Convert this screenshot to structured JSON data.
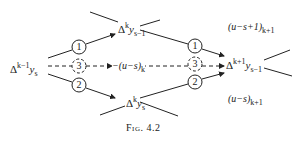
{
  "diagram": {
    "nodes": {
      "left": {
        "base": "Δ",
        "sup": "k−1",
        "var": "y",
        "sub": "s"
      },
      "top": {
        "base": "Δ",
        "sup": "k",
        "var": "y",
        "sub": "s−1"
      },
      "bottom": {
        "base": "Δ",
        "sup": "k",
        "var": "y",
        "sub": "s"
      },
      "right": {
        "base": "Δ",
        "sup": "k+1",
        "var": "y",
        "sub": "s−1"
      }
    },
    "circles": {
      "c1": "1",
      "c2": "2",
      "c3": "3",
      "r1": "1",
      "r2": "2",
      "r3": "3"
    },
    "mid_label": {
      "text": "−(u−s)",
      "sub": "k"
    },
    "upper_coef": {
      "text": "(u−s+1)",
      "sub": "k+1"
    },
    "lower_coef": {
      "text": "(u−s)",
      "sub": "k+1"
    },
    "caption": "Fig. 4.2"
  }
}
